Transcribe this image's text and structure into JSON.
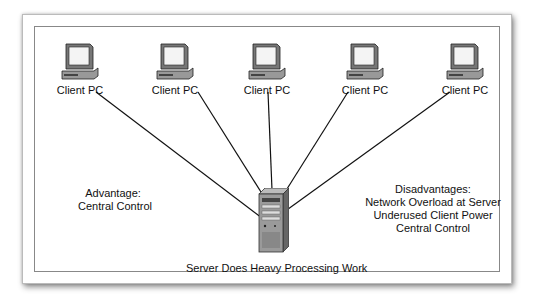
{
  "diagram": {
    "clients": [
      {
        "label": "Client PC",
        "x": 80
      },
      {
        "label": "Client PC",
        "x": 175
      },
      {
        "label": "Client PC",
        "x": 267
      },
      {
        "label": "Client PC",
        "x": 365
      },
      {
        "label": "Client PC",
        "x": 465
      }
    ],
    "server": {
      "label": "Server Does Heavy Processing Work"
    },
    "advantage": {
      "title": "Advantage:",
      "items": [
        "Central Control"
      ]
    },
    "disadvantages": {
      "title": "Disadvantages:",
      "items": [
        "Network Overload at Server",
        "Underused Client Power",
        "Central Control"
      ]
    },
    "colors": {
      "line": "#111111",
      "monitor": "#555555",
      "screen": "#f4f4f4"
    }
  }
}
